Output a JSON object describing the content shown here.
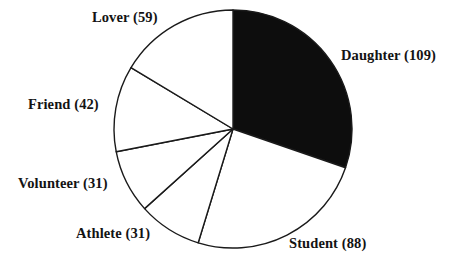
{
  "chart_data": {
    "type": "pie",
    "title": "",
    "subtitle": "",
    "xlabel": "",
    "ylabel": "",
    "legend_position": "none",
    "grid": false,
    "total": 360,
    "start_angle_deg": 0,
    "direction": "clockwise",
    "center": {
      "x": 233,
      "y": 129
    },
    "radius": 119,
    "categories": [
      "Daughter",
      "Student",
      "Athlete",
      "Volunteer",
      "Friend",
      "Lover"
    ],
    "values": [
      109,
      88,
      31,
      31,
      42,
      59
    ],
    "slices": [
      {
        "name": "Daughter",
        "value": 109,
        "label": "Daughter (109)",
        "fill": "#0d0d0d",
        "stroke": "#1a1a1a",
        "start_deg": 0,
        "end_deg": 109,
        "percent": 30.3
      },
      {
        "name": "Student",
        "value": 88,
        "label": "Student (88)",
        "fill": "#ffffff",
        "stroke": "#1a1a1a",
        "start_deg": 109,
        "end_deg": 197,
        "percent": 24.4
      },
      {
        "name": "Athlete",
        "value": 31,
        "label": "Athlete (31)",
        "fill": "#ffffff",
        "stroke": "#1a1a1a",
        "start_deg": 197,
        "end_deg": 228,
        "percent": 8.6
      },
      {
        "name": "Volunteer",
        "value": 31,
        "label": "Volunteer (31)",
        "fill": "#ffffff",
        "stroke": "#1a1a1a",
        "start_deg": 228,
        "end_deg": 259,
        "percent": 8.6
      },
      {
        "name": "Friend",
        "value": 42,
        "label": "Friend (42)",
        "fill": "#ffffff",
        "stroke": "#1a1a1a",
        "start_deg": 259,
        "end_deg": 301,
        "percent": 11.7
      },
      {
        "name": "Lover",
        "value": 59,
        "label": "Lover (59)",
        "fill": "#ffffff",
        "stroke": "#1a1a1a",
        "start_deg": 301,
        "end_deg": 360,
        "percent": 16.4
      }
    ],
    "colors": {
      "background": "#ffffff",
      "outline": "#1a1a1a",
      "highlight_fill": "#0d0d0d",
      "default_fill": "#ffffff",
      "text": "#131313"
    }
  }
}
